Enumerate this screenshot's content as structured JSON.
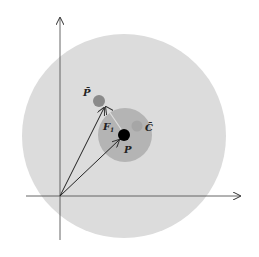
{
  "diagram": {
    "labels": {
      "p_bar": "P̄",
      "c_bar": "C̄",
      "p": "P",
      "f1": "F",
      "f1_sub": "1"
    },
    "colors": {
      "outer_region": "#dcdcdc",
      "inner_region": "#b4b4b4",
      "p_point": "#000000",
      "p_bar_point": "#8a8a8a",
      "c_bar_point": "#a6a6a6",
      "axes": "#555555",
      "arrows": "#222222"
    }
  }
}
